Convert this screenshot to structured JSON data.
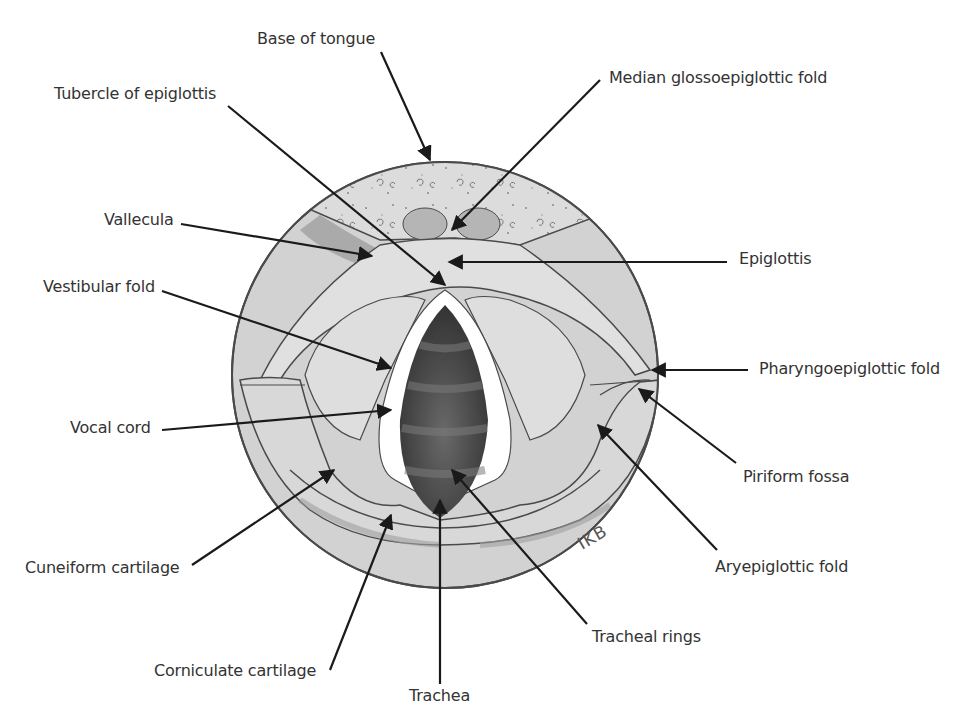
{
  "figure": {
    "signature": "IKB",
    "colors": {
      "background": "#ffffff",
      "outline": "#4a4a4a",
      "mucosa": "#d2d2d2",
      "mucosa_light": "#e2e2e2",
      "mucosa_shadow": "#a8a8a8",
      "tongue": "#dcdcdc",
      "vocal_cord": "#ffffff",
      "trachea_dark": "#3e3e3e",
      "trachea_ring": "#6a6a6a",
      "label_text": "#333333",
      "leader_line": "#1a1a1a"
    }
  },
  "labels": {
    "base_of_tongue": "Base of tongue",
    "median_glossoepiglottic_fold": "Median glossoepiglottic fold",
    "tubercle_of_epiglottis": "Tubercle of epiglottis",
    "vallecula": "Vallecula",
    "epiglottis": "Epiglottis",
    "vestibular_fold": "Vestibular fold",
    "pharyngoepiglottic_fold": "Pharyngoepiglottic fold",
    "vocal_cord": "Vocal cord",
    "piriform_fossa": "Piriform fossa",
    "cuneiform_cartilage": "Cuneiform cartilage",
    "aryepiglottic_fold": "Aryepiglottic fold",
    "tracheal_rings": "Tracheal rings",
    "corniculate_cartilage": "Corniculate cartilage",
    "trachea": "Trachea"
  }
}
